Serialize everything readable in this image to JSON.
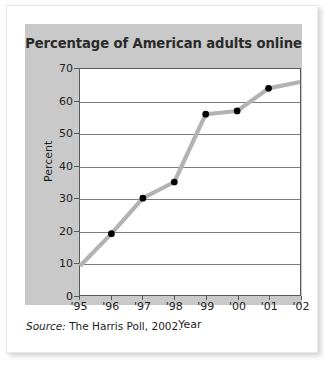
{
  "figure": {
    "title": "Percentage of American adults online",
    "source_label": "Source:",
    "source_text": "The Harris Poll, 2002.",
    "panel_color": "#c9c9c9",
    "plot_background": "#ffffff",
    "line_color": "#b3b3b3",
    "marker_color": "#000000",
    "grid_color": "#7c7c7c",
    "text_color": "#1d1d1d"
  },
  "chart_data": {
    "type": "line",
    "title": "Percentage of American adults online",
    "xlabel": "Year",
    "ylabel": "Percent",
    "x": [
      "'95",
      "'96",
      "'97",
      "'98",
      "'99",
      "'00",
      "'01",
      "'02"
    ],
    "values": [
      9,
      19,
      30,
      35,
      56,
      57,
      64,
      66
    ],
    "markers": [
      false,
      true,
      true,
      true,
      true,
      true,
      true,
      false
    ],
    "xtick_labels": [
      "'95",
      "'96",
      "'97",
      "'98",
      "'99",
      "'00",
      "'01",
      "'02"
    ],
    "ytick_labels": [
      "0",
      "10",
      "20",
      "30",
      "40",
      "50",
      "60",
      "70"
    ],
    "yticks": [
      0,
      10,
      20,
      30,
      40,
      50,
      60,
      70
    ],
    "ylim": [
      0,
      70
    ],
    "grid": "horizontal",
    "legend": "none"
  }
}
